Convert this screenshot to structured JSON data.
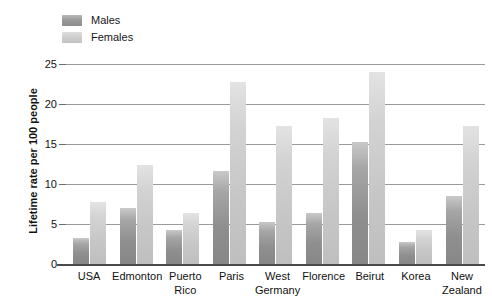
{
  "chart_data": {
    "type": "bar",
    "title": "",
    "xlabel": "",
    "ylabel": "Lifetime rate per 100 people",
    "ylim": [
      0,
      25
    ],
    "yticks": [
      0,
      5,
      10,
      15,
      20,
      25
    ],
    "grid": true,
    "legend_position": "top-left",
    "categories": [
      "USA",
      "Edmonton",
      "Puerto Rico",
      "Paris",
      "West Germany",
      "Florence",
      "Beirut",
      "Korea",
      "New Zealand"
    ],
    "category_lines": [
      [
        "USA"
      ],
      [
        "Edmonton"
      ],
      [
        "Puerto",
        "Rico"
      ],
      [
        "Paris"
      ],
      [
        "West",
        "Germany"
      ],
      [
        "Florence"
      ],
      [
        "Beirut"
      ],
      [
        "Korea"
      ],
      [
        "New",
        "Zealand"
      ]
    ],
    "series": [
      {
        "name": "Males",
        "color": "#9a9a9a",
        "values": [
          3.3,
          7.0,
          4.2,
          11.6,
          5.3,
          6.4,
          15.2,
          2.7,
          8.5
        ]
      },
      {
        "name": "Females",
        "color": "#cfcfcf",
        "values": [
          7.8,
          12.4,
          6.4,
          22.7,
          17.3,
          18.2,
          24.0,
          4.3,
          17.2
        ]
      }
    ]
  },
  "legend": {
    "items": [
      {
        "label": "Males"
      },
      {
        "label": "Females"
      }
    ]
  },
  "axis": {
    "y_title": "Lifetime rate per 100 people",
    "y_tick_labels": [
      "0",
      "5",
      "10",
      "15",
      "20",
      "25"
    ]
  }
}
